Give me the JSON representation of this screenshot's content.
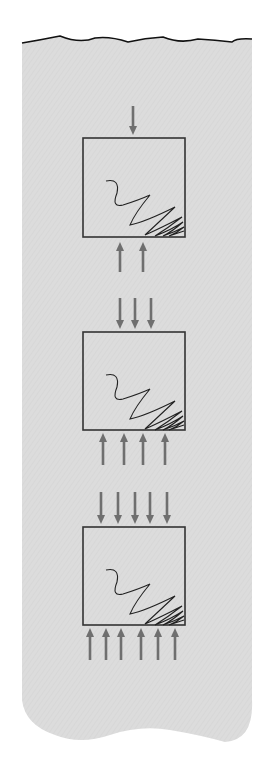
{
  "figure": {
    "colors": {
      "background": "#ffffff",
      "paper": "#dcdcdc",
      "paper_edge": "#111111",
      "box_stroke": "#333333",
      "arrow": "#6f6f6f",
      "scribble": "#222222"
    },
    "panels": [
      {
        "id": "panel-1",
        "box": {
          "x": 83,
          "y": 138,
          "w": 102,
          "h": 99
        },
        "top_arrows_x": [
          133
        ],
        "top_arrows_y": [
          106,
          135
        ],
        "bottom_arrows_x": [
          120,
          143
        ],
        "bottom_arrows_y": [
          272,
          242
        ]
      },
      {
        "id": "panel-2",
        "box": {
          "x": 83,
          "y": 332,
          "w": 102,
          "h": 98
        },
        "top_arrows_x": [
          120,
          135,
          151
        ],
        "top_arrows_y": [
          298,
          329
        ],
        "bottom_arrows_x": [
          103,
          124,
          143,
          165
        ],
        "bottom_arrows_y": [
          465,
          433
        ]
      },
      {
        "id": "panel-3",
        "box": {
          "x": 83,
          "y": 527,
          "w": 102,
          "h": 98
        },
        "top_arrows_x": [
          101,
          118,
          135,
          150,
          167
        ],
        "top_arrows_y": [
          492,
          524
        ],
        "bottom_arrows_x": [
          90,
          106,
          121,
          141,
          158,
          175
        ],
        "bottom_arrows_y": [
          660,
          628
        ]
      }
    ]
  }
}
